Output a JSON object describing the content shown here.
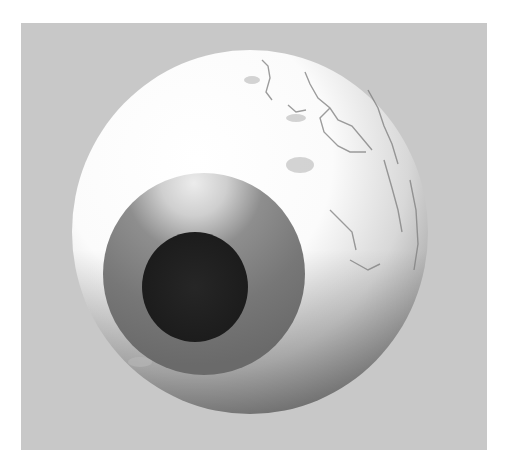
{
  "scene": {
    "subject": "3D rendered eyeball",
    "background_color": "#c8c8c8",
    "border_color": "#ffffff",
    "eyeball": {
      "cx": 250,
      "cy": 232,
      "rx": 178,
      "ry": 182,
      "sclera_color": "#ffffff",
      "shade_color": "#8a8a8a"
    },
    "iris": {
      "cx": 204,
      "cy": 274,
      "r": 101,
      "color": "#7a7a7a",
      "highlight_color": "#e6e6e6"
    },
    "pupil": {
      "cx": 195,
      "cy": 287,
      "rx": 53,
      "ry": 55,
      "color": "#232323"
    }
  }
}
